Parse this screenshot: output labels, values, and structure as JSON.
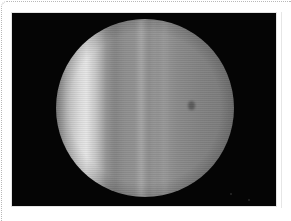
{
  "image": {
    "subject": "planet",
    "description": "Grayscale photograph of a gas giant planet disc on black background",
    "colors": {
      "background": "#050505",
      "page": "#ffffff",
      "frame_border": "#b8b8b8",
      "planet_bright_band": "#e6e6e6",
      "planet_base": "#8c8c8c"
    },
    "features": [
      "bright-limb-band",
      "vertical-streaks",
      "dark-spot"
    ]
  }
}
